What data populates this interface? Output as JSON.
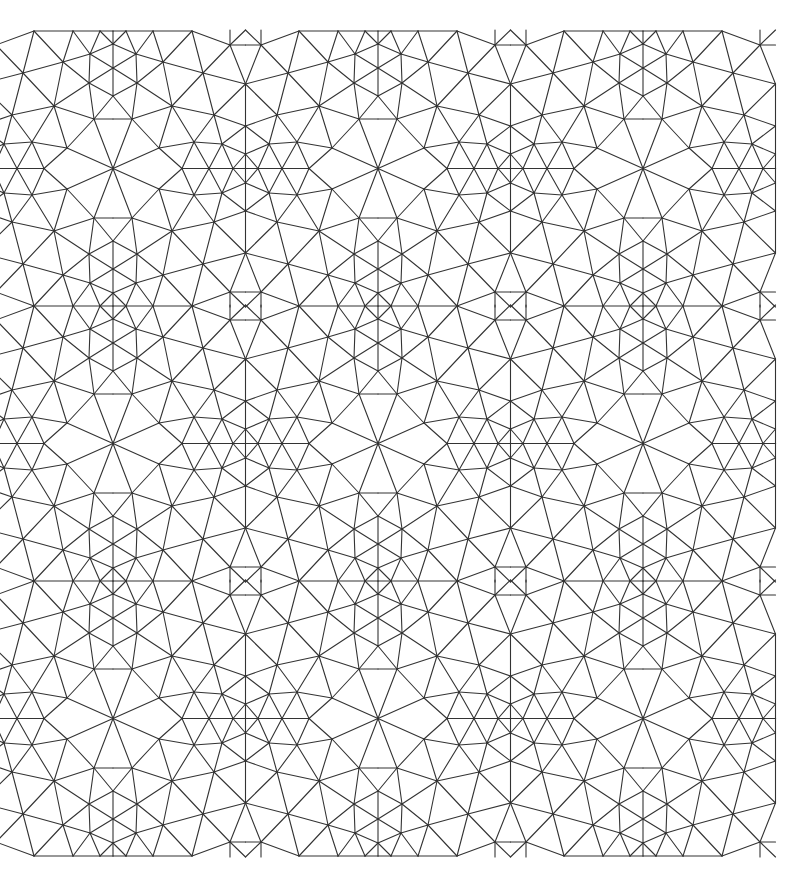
{
  "canvas": {
    "width": 808,
    "height": 888,
    "background": "#ffffff",
    "stroke_color": "#333333",
    "description": "Repeating triangular mesh tiling pattern"
  },
  "tiling": {
    "period_x": 265,
    "period_y": 275,
    "cell_centers_x": [
      113,
      378,
      643
    ],
    "mirror_lines_x": [
      -19.5,
      245.5,
      510.5,
      775.5
    ],
    "top_edge_y": 31,
    "bottom_edge_y": 856,
    "center_lines_y": [
      168.5,
      443.5,
      718.5
    ],
    "quarter_origin": [
      113,
      31
    ],
    "quarter_size": [
      132.5,
      137.5
    ],
    "quarter_edges": [
      [
        [
          113,
          31
        ],
        [
          126,
          31
        ]
      ],
      [
        [
          126,
          31
        ],
        [
          153,
          31
        ]
      ],
      [
        [
          153,
          31
        ],
        [
          192,
          31
        ]
      ],
      [
        [
          113,
          31
        ],
        [
          113,
          44
        ]
      ],
      [
        [
          113,
          44
        ],
        [
          113,
          68
        ]
      ],
      [
        [
          113,
          68
        ],
        [
          113,
          96
        ]
      ],
      [
        [
          126,
          31
        ],
        [
          113,
          44
        ]
      ],
      [
        [
          126,
          31
        ],
        [
          136,
          54
        ]
      ],
      [
        [
          153,
          31
        ],
        [
          136,
          54
        ]
      ],
      [
        [
          153,
          31
        ],
        [
          163,
          62
        ]
      ],
      [
        [
          192,
          31
        ],
        [
          163,
          62
        ]
      ],
      [
        [
          192,
          31
        ],
        [
          203,
          73
        ]
      ],
      [
        [
          192,
          31
        ],
        [
          230,
          45
        ]
      ],
      [
        [
          230,
          45
        ],
        [
          245.5,
          45
        ]
      ],
      [
        [
          230,
          45
        ],
        [
          245.5,
          30
        ]
      ],
      [
        [
          230,
          30
        ],
        [
          230,
          45
        ]
      ],
      [
        [
          113,
          44
        ],
        [
          136,
          54
        ]
      ],
      [
        [
          136,
          54
        ],
        [
          163,
          62
        ]
      ],
      [
        [
          163,
          62
        ],
        [
          203,
          73
        ]
      ],
      [
        [
          203,
          73
        ],
        [
          245.5,
          84
        ]
      ],
      [
        [
          113,
          68
        ],
        [
          136,
          54
        ]
      ],
      [
        [
          113,
          68
        ],
        [
          137,
          83
        ]
      ],
      [
        [
          136,
          54
        ],
        [
          137,
          83
        ]
      ],
      [
        [
          230,
          45
        ],
        [
          245.5,
          84
        ]
      ],
      [
        [
          230,
          45
        ],
        [
          203,
          73
        ]
      ],
      [
        [
          163,
          62
        ],
        [
          172,
          106
        ]
      ],
      [
        [
          163,
          62
        ],
        [
          137,
          83
        ]
      ],
      [
        [
          137,
          83
        ],
        [
          172,
          106
        ]
      ],
      [
        [
          137,
          83
        ],
        [
          113,
          96
        ]
      ],
      [
        [
          137,
          83
        ],
        [
          132,
          119
        ]
      ],
      [
        [
          203,
          73
        ],
        [
          172,
          106
        ]
      ],
      [
        [
          203,
          73
        ],
        [
          214,
          115
        ]
      ],
      [
        [
          245.5,
          84
        ],
        [
          214,
          115
        ]
      ],
      [
        [
          132,
          119
        ],
        [
          172,
          106
        ]
      ],
      [
        [
          172,
          106
        ],
        [
          214,
          115
        ]
      ],
      [
        [
          214,
          115
        ],
        [
          245.5,
          126
        ]
      ],
      [
        [
          113,
          96
        ],
        [
          132,
          119
        ]
      ],
      [
        [
          113,
          119
        ],
        [
          132,
          119
        ]
      ],
      [
        [
          132,
          119
        ],
        [
          159,
          148
        ]
      ],
      [
        [
          172,
          106
        ],
        [
          159,
          148
        ]
      ],
      [
        [
          172,
          106
        ],
        [
          194,
          142
        ]
      ],
      [
        [
          214,
          115
        ],
        [
          194,
          142
        ]
      ],
      [
        [
          214,
          115
        ],
        [
          222,
          144
        ]
      ],
      [
        [
          245.5,
          126
        ],
        [
          222,
          144
        ]
      ],
      [
        [
          245.5,
          84
        ],
        [
          245.5,
          126
        ]
      ],
      [
        [
          245.5,
          126
        ],
        [
          245.5,
          154
        ]
      ],
      [
        [
          245.5,
          154
        ],
        [
          245.5,
          168.5
        ]
      ],
      [
        [
          159,
          148
        ],
        [
          194,
          142
        ]
      ],
      [
        [
          194,
          142
        ],
        [
          222,
          144
        ]
      ],
      [
        [
          222,
          144
        ],
        [
          245.5,
          154
        ]
      ],
      [
        [
          159,
          148
        ],
        [
          182,
          168.5
        ]
      ],
      [
        [
          194,
          142
        ],
        [
          182,
          168.5
        ]
      ],
      [
        [
          194,
          142
        ],
        [
          209,
          168.5
        ]
      ],
      [
        [
          222,
          144
        ],
        [
          209,
          168.5
        ]
      ],
      [
        [
          222,
          144
        ],
        [
          233,
          168.5
        ]
      ],
      [
        [
          245.5,
          154
        ],
        [
          233,
          168.5
        ]
      ],
      [
        [
          182,
          168.5
        ],
        [
          209,
          168.5
        ]
      ],
      [
        [
          209,
          168.5
        ],
        [
          233,
          168.5
        ]
      ],
      [
        [
          233,
          168.5
        ],
        [
          245.5,
          168.5
        ]
      ],
      [
        [
          113,
          168.5
        ],
        [
          132,
          119
        ]
      ],
      [
        [
          113,
          168.5
        ],
        [
          159,
          148
        ]
      ]
    ]
  }
}
